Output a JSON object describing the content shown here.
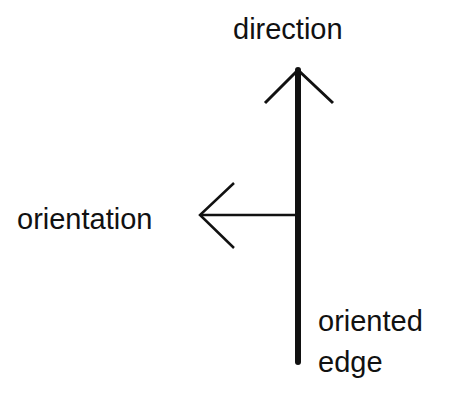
{
  "diagram": {
    "labels": {
      "direction": "direction",
      "orientation": "orientation",
      "oriented_line1": "oriented",
      "oriented_line2": "edge"
    },
    "colors": {
      "stroke": "#111111",
      "background": "#ffffff"
    }
  }
}
